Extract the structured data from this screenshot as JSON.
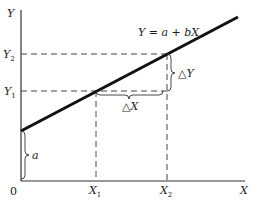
{
  "diagram": {
    "axes": {
      "y_label": "Y",
      "x_label": "X",
      "origin_label": "0"
    },
    "equation_label": "Y = a + bX",
    "y_ticks": [
      {
        "label": "Y₂",
        "base": "Y",
        "sub": "2"
      },
      {
        "label": "Y₁",
        "base": "Y",
        "sub": "1"
      }
    ],
    "x_ticks": [
      {
        "label": "X₁",
        "base": "X",
        "sub": "1"
      },
      {
        "label": "X₂",
        "base": "X",
        "sub": "2"
      }
    ],
    "braces": {
      "intercept": "a",
      "delta_y": "△Y",
      "delta_x": "△X"
    },
    "colors": {
      "line": "#111111",
      "axis": "#333333",
      "dashed": "#444444"
    }
  }
}
